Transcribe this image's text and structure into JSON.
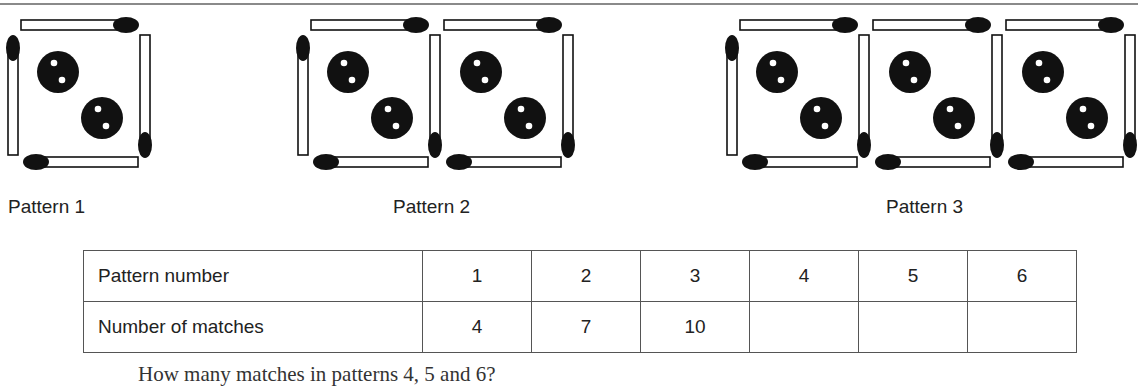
{
  "patterns": [
    {
      "label": "Pattern 1",
      "squares": 1
    },
    {
      "label": "Pattern 2",
      "squares": 2
    },
    {
      "label": "Pattern 3",
      "squares": 3
    }
  ],
  "table": {
    "rows": [
      {
        "header": "Pattern number",
        "cells": [
          "1",
          "2",
          "3",
          "4",
          "5",
          "6"
        ]
      },
      {
        "header": "Number of matches",
        "cells": [
          "4",
          "7",
          "10",
          "",
          "",
          ""
        ]
      }
    ]
  },
  "question": "How many matches in patterns 4, 5 and 6?",
  "colors": {
    "ink": "#111111",
    "rule": "#8a8a8a",
    "table_border": "#555555"
  }
}
